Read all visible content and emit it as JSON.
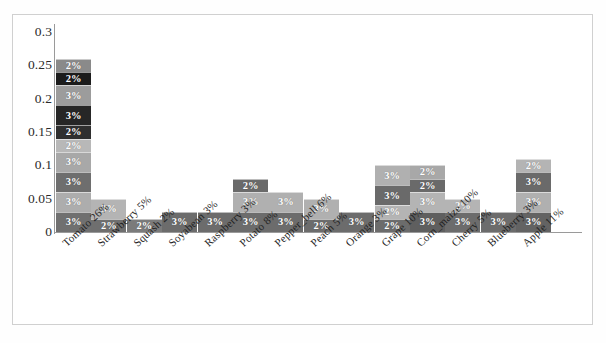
{
  "chart_data": {
    "type": "bar",
    "subtype": "stacked-bar",
    "title": "",
    "xlabel": "",
    "ylabel": "",
    "ylim": [
      0,
      0.3
    ],
    "ytick_labels": [
      "0.3",
      "0.25",
      "0.2",
      "0.15",
      "0.1",
      "0.05",
      "0"
    ],
    "ytick_values": [
      0.3,
      0.25,
      0.2,
      0.15,
      0.1,
      0.05,
      0
    ],
    "grid": false,
    "legend": "none",
    "categories": [
      "Tomato 26%",
      "Strawberry 5%",
      "Squash 2%",
      "Soyabean 3%",
      "Raspberry 3%",
      "Potato 8%",
      "Pepper_bell 6%",
      "Peach 5%",
      "Orange 3%",
      "Grape 10%",
      "Corn_maize 10%",
      "Cherry 5%",
      "Blueberry 3%",
      "Apple 11%"
    ],
    "values": [
      0.26,
      0.05,
      0.02,
      0.03,
      0.03,
      0.08,
      0.06,
      0.05,
      0.03,
      0.1,
      0.1,
      0.05,
      0.03,
      0.11
    ],
    "series": [
      {
        "name": "Tomato 26%",
        "total": 0.26,
        "segments": [
          {
            "label": "3%",
            "value": 0.03,
            "color": "#707070"
          },
          {
            "label": "3%",
            "value": 0.03,
            "color": "#adadad"
          },
          {
            "label": "3%",
            "value": 0.03,
            "color": "#6e6e6e"
          },
          {
            "label": "3%",
            "value": 0.03,
            "color": "#a8a8a8"
          },
          {
            "label": "2%",
            "value": 0.02,
            "color": "#b8b8b8"
          },
          {
            "label": "2%",
            "value": 0.02,
            "color": "#2f2f2f"
          },
          {
            "label": "3%",
            "value": 0.03,
            "color": "#262626"
          },
          {
            "label": "3%",
            "value": 0.03,
            "color": "#9c9c9c"
          },
          {
            "label": "2%",
            "value": 0.02,
            "color": "#1c1c1c"
          },
          {
            "label": "2%",
            "value": 0.02,
            "color": "#8a8a8a"
          }
        ]
      },
      {
        "name": "Strawberry 5%",
        "total": 0.05,
        "segments": [
          {
            "label": "2%",
            "value": 0.02,
            "color": "#6f6f6f"
          },
          {
            "label": "3%",
            "value": 0.03,
            "color": "#b4b4b4"
          }
        ]
      },
      {
        "name": "Squash 2%",
        "total": 0.02,
        "segments": [
          {
            "label": "2%",
            "value": 0.02,
            "color": "#7b7b7b"
          }
        ]
      },
      {
        "name": "Soyabean 3%",
        "total": 0.03,
        "segments": [
          {
            "label": "3%",
            "value": 0.03,
            "color": "#6c6c6c"
          }
        ]
      },
      {
        "name": "Raspberry 3%",
        "total": 0.03,
        "segments": [
          {
            "label": "3%",
            "value": 0.03,
            "color": "#6c6c6c"
          }
        ]
      },
      {
        "name": "Potato 8%",
        "total": 0.08,
        "segments": [
          {
            "label": "3%",
            "value": 0.03,
            "color": "#6c6c6c"
          },
          {
            "label": "3%",
            "value": 0.03,
            "color": "#b0b0b0"
          },
          {
            "label": "2%",
            "value": 0.02,
            "color": "#6a6a6a"
          }
        ]
      },
      {
        "name": "Pepper_bell 6%",
        "total": 0.06,
        "segments": [
          {
            "label": "3%",
            "value": 0.03,
            "color": "#6c6c6c"
          },
          {
            "label": "3%",
            "value": 0.03,
            "color": "#b0b0b0"
          }
        ]
      },
      {
        "name": "Peach 5%",
        "total": 0.05,
        "segments": [
          {
            "label": "2%",
            "value": 0.02,
            "color": "#6c6c6c"
          },
          {
            "label": "3%",
            "value": 0.03,
            "color": "#b0b0b0"
          }
        ]
      },
      {
        "name": "Orange 3%",
        "total": 0.03,
        "segments": [
          {
            "label": "3%",
            "value": 0.03,
            "color": "#6c6c6c"
          }
        ]
      },
      {
        "name": "Grape 10%",
        "total": 0.1,
        "segments": [
          {
            "label": "2%",
            "value": 0.02,
            "color": "#6c6c6c"
          },
          {
            "label": "2%",
            "value": 0.02,
            "color": "#b4b4b4"
          },
          {
            "label": "3%",
            "value": 0.03,
            "color": "#6a6a6a"
          },
          {
            "label": "3%",
            "value": 0.03,
            "color": "#b0b0b0"
          }
        ]
      },
      {
        "name": "Corn_maize 10%",
        "total": 0.1,
        "segments": [
          {
            "label": "3%",
            "value": 0.03,
            "color": "#5f5f5f"
          },
          {
            "label": "3%",
            "value": 0.03,
            "color": "#b4b4b4"
          },
          {
            "label": "2%",
            "value": 0.02,
            "color": "#6a6a6a"
          },
          {
            "label": "2%",
            "value": 0.02,
            "color": "#a8a8a8"
          }
        ]
      },
      {
        "name": "Cherry 5%",
        "total": 0.05,
        "segments": [
          {
            "label": "3%",
            "value": 0.03,
            "color": "#6c6c6c"
          },
          {
            "label": "2%",
            "value": 0.02,
            "color": "#b4b4b4"
          }
        ]
      },
      {
        "name": "Blueberry 3%",
        "total": 0.03,
        "segments": [
          {
            "label": "3%",
            "value": 0.03,
            "color": "#6c6c6c"
          }
        ]
      },
      {
        "name": "Apple 11%",
        "total": 0.11,
        "segments": [
          {
            "label": "3%",
            "value": 0.03,
            "color": "#636363"
          },
          {
            "label": "3%",
            "value": 0.03,
            "color": "#b0b0b0"
          },
          {
            "label": "3%",
            "value": 0.03,
            "color": "#6a6a6a"
          },
          {
            "label": "2%",
            "value": 0.02,
            "color": "#b4b4b4"
          }
        ]
      }
    ]
  },
  "axis": {
    "y_max": 0.3,
    "y_min": 0
  }
}
